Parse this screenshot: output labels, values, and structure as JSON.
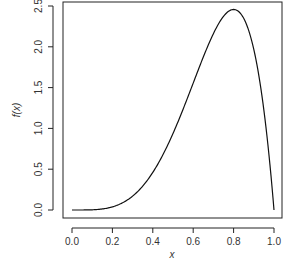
{
  "chart_data": {
    "type": "line",
    "title": "",
    "xlabel": "x",
    "ylabel": "f(x)",
    "xlim": [
      0.0,
      1.0
    ],
    "ylim": [
      0.0,
      2.5
    ],
    "grid": false,
    "legend": null,
    "x_ticks": [
      "0.0",
      "0.2",
      "0.4",
      "0.6",
      "0.8",
      "1.0"
    ],
    "y_ticks": [
      "0.0",
      "0.5",
      "1.0",
      "1.5",
      "2.0",
      "2.5"
    ],
    "series": [
      {
        "name": "f(x)",
        "x": [
          0.0,
          0.1,
          0.2,
          0.3,
          0.4,
          0.5,
          0.6,
          0.7,
          0.8,
          0.9,
          0.95,
          1.0
        ],
        "values": [
          0.0,
          0.0027,
          0.0384,
          0.1701,
          0.4608,
          0.9375,
          1.5552,
          2.1609,
          2.4576,
          1.9683,
          1.2217,
          0.0
        ]
      }
    ]
  }
}
